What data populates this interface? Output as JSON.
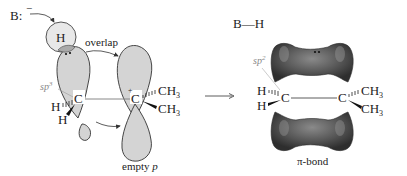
{
  "diagram": {
    "left_panel": {
      "base_label": "B:",
      "base_charge": "−",
      "hydrogen_label": "H",
      "overlap_label": "overlap",
      "hybrid_label": "sp",
      "hybrid_sup": "3",
      "carbon_left": "C",
      "carbon_right": "C",
      "carbocation_charge": "+",
      "substituents_left": [
        "H",
        "H"
      ],
      "methyl_1": "CH",
      "methyl_1_sub": "3",
      "methyl_2": "CH",
      "methyl_2_sub": "3",
      "empty_p_label": "empty",
      "empty_p_italic": "p"
    },
    "arrow": {
      "type": "reaction-arrow"
    },
    "right_panel": {
      "product_label": "B—H",
      "hybrid_label": "sp",
      "hybrid_sup": "2",
      "carbon_left": "C",
      "carbon_right": "C",
      "substituents_left": [
        "H",
        "H"
      ],
      "methyl_1": "CH",
      "methyl_1_sub": "3",
      "methyl_2": "CH",
      "methyl_2_sub": "3",
      "pi_bond_label": "π-bond"
    },
    "colors": {
      "orbital_fill": "#d4d4d4",
      "pi_bond_dark": "#3a3a3a",
      "pi_bond_light": "#7a7a7a",
      "hybrid_label": "#888888"
    }
  }
}
